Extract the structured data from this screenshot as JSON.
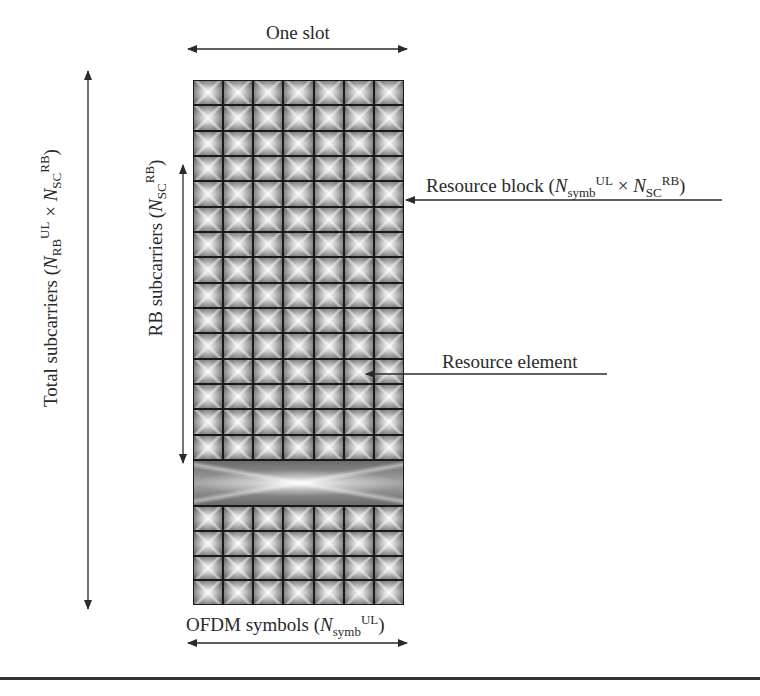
{
  "diagram": {
    "one_slot_label": "One slot",
    "total_subcarriers_label": {
      "prefix": "Total subcarriers (",
      "n1": "N",
      "n1_sub": "RB",
      "n1_sup": "UL",
      "times": " × ",
      "n2": "N",
      "n2_sub": "SC",
      "n2_sup": "RB",
      "suffix": ")"
    },
    "rb_subcarriers_label": {
      "prefix": "RB subcarriers (",
      "n": "N",
      "n_sub": "SC",
      "n_sup": "RB",
      "suffix": ")"
    },
    "resource_block_label": {
      "prefix": "Resource block (",
      "n1": "N",
      "n1_sub": "symb",
      "n1_sup": "UL",
      "times": " × ",
      "n2": "N",
      "n2_sub": "SC",
      "n2_sup": "RB",
      "suffix": ")"
    },
    "resource_element_label": "Resource element",
    "ofdm_symbols_label": {
      "prefix": "OFDM symbols (",
      "n": "N",
      "n_sub": "symb",
      "n_sup": "UL",
      "suffix": ")"
    },
    "grid": {
      "columns": 7,
      "top_rows": 15,
      "bottom_rows": 4,
      "collapsed_band": "omitted subcarriers (wide band)"
    },
    "colors": {
      "line": "#2a2a2a",
      "cell_dark": "#5c5c5c",
      "cell_light": "#f2f2f2",
      "divider": "#333333"
    }
  }
}
